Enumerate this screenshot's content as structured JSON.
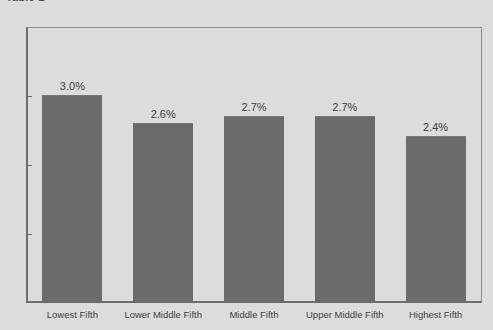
{
  "chart_data": {
    "type": "bar",
    "title": "Table 1",
    "xlabel": "",
    "ylabel": "",
    "categories": [
      "Lowest Fifth",
      "Lower Middle Fifth",
      "Middle Fifth",
      "Upper Middle Fifth",
      "Highest Fifth"
    ],
    "values": [
      3.0,
      2.6,
      2.7,
      2.7,
      2.4
    ],
    "data_labels": [
      "3.0%",
      "2.6%",
      "2.7%",
      "2.7%",
      "2.4%"
    ],
    "ylim": [
      0,
      4
    ],
    "ytick_values": [
      0,
      1,
      2,
      3,
      4
    ],
    "ytick_labels": [
      "0%",
      "1%",
      "2%",
      "3%",
      "4%"
    ],
    "grid": false,
    "legend": null,
    "bar_color": "#6b6b6b",
    "background_color": "#dcdcdc",
    "axis_color": "#6e6e6e",
    "text_color": "#3d3d3d"
  }
}
